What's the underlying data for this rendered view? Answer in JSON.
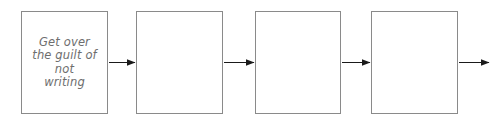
{
  "diagram": {
    "type": "horizontal-flowchart",
    "background_color": "#ffffff",
    "box_border_color": "#8a8a8a",
    "text_color": "#6e6e6e",
    "arrow_color": "#1a1a1a",
    "nodes": [
      {
        "id": "node-1",
        "label": "Get over\nthe guilt of\nnot\nwriting",
        "x": 21,
        "width": 87
      },
      {
        "id": "node-2",
        "label": "",
        "x": 136,
        "width": 87
      },
      {
        "id": "node-3",
        "label": "",
        "x": 255,
        "width": 86
      },
      {
        "id": "node-4",
        "label": "",
        "x": 371,
        "width": 87
      }
    ],
    "connectors": [
      {
        "id": "arrow-1",
        "from": "node-1",
        "to": "node-2"
      },
      {
        "id": "arrow-2",
        "from": "node-2",
        "to": "node-3"
      },
      {
        "id": "arrow-3",
        "from": "node-3",
        "to": "node-4"
      },
      {
        "id": "arrow-4",
        "from": "node-4",
        "to": ""
      }
    ]
  }
}
